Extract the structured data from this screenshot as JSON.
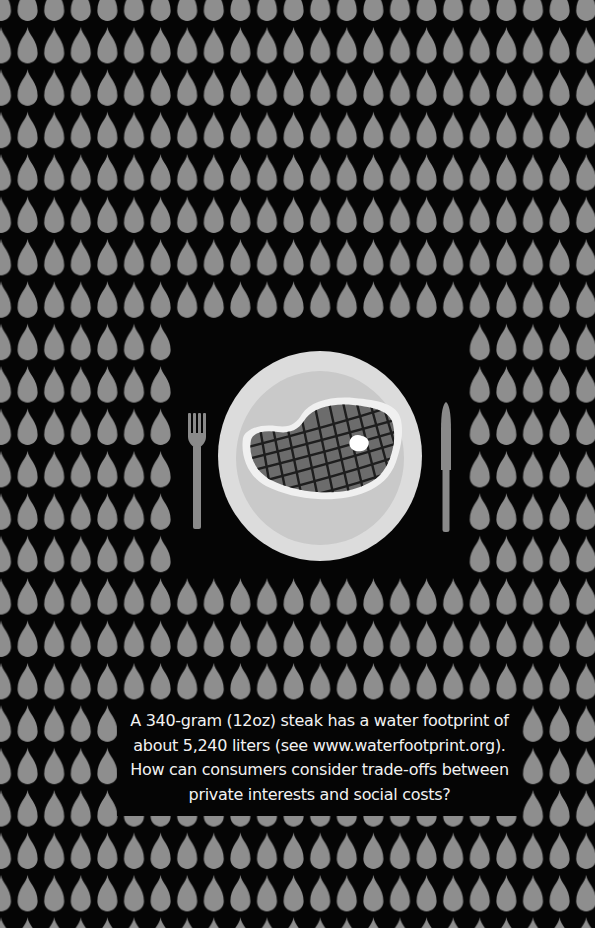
{
  "poster": {
    "caption": "A 340-gram (12oz) steak has a water footprint of about 5,240 liters (see www.waterfootprint.org). How can consumers consider trade-offs between private interests and social costs?",
    "illustration": {
      "subject": "steak on plate with fork and knife",
      "pattern_icon": "water-drop-icon"
    }
  },
  "colors": {
    "background": "#050505",
    "drop": "#8e8e8e",
    "plate_rim": "#dcdcdc",
    "plate_well": "#c9c9c9",
    "steak_fat": "#f0f0f0",
    "steak_meat": "#6c6c6c",
    "grill_marks": "#1e1e1e",
    "cutlery": "#8a8a8a",
    "text": "#f2f2f2"
  },
  "pattern": {
    "col_pitch": 26.6,
    "row_pitch": 42.4,
    "first_col_x": 1,
    "first_row_bulb_bottom_y": 21
  }
}
